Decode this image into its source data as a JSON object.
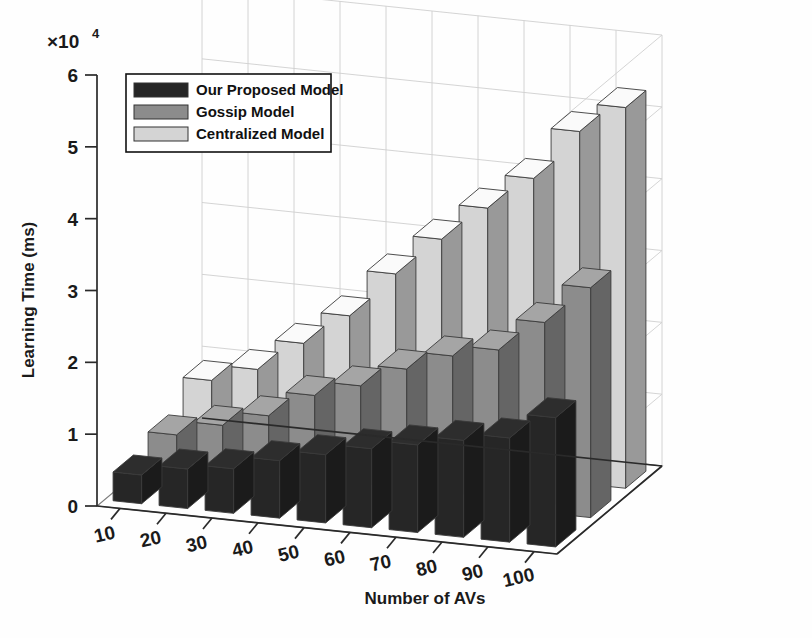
{
  "figure": {
    "title": "",
    "background": "#ffffff"
  },
  "axes": {
    "y_exponent_label": "×10",
    "y_exponent_sup": "4",
    "y_title": "Learning Time (ms)",
    "x_title": "Number of AVs",
    "y_ticks": [
      "0",
      "1",
      "2",
      "3",
      "4",
      "5",
      "6"
    ],
    "x_ticks": [
      "10",
      "20",
      "30",
      "40",
      "50",
      "60",
      "70",
      "80",
      "90",
      "100"
    ]
  },
  "legend": {
    "position": "top-left",
    "items": [
      {
        "label": "Our Proposed Model",
        "color": "#262626"
      },
      {
        "label": "Gossip Model",
        "color": "#8c8c8c"
      },
      {
        "label": "Centralized Model",
        "color": "#d4d4d4"
      }
    ]
  },
  "chart_data": {
    "type": "bar",
    "render": "3d-grouped-bar",
    "title": "",
    "xlabel": "Number of AVs",
    "ylabel": "Learning Time (ms)",
    "y_scale_factor": 10000,
    "y_scale_label": "×10^4",
    "ylim": [
      0,
      6
    ],
    "grid": true,
    "categories": [
      "10",
      "20",
      "30",
      "40",
      "50",
      "60",
      "70",
      "80",
      "90",
      "100"
    ],
    "series": [
      {
        "name": "Our Proposed Model",
        "color": "#262626",
        "values": [
          0.4,
          0.55,
          0.62,
          0.8,
          0.95,
          1.1,
          1.22,
          1.35,
          1.45,
          1.8
        ]
      },
      {
        "name": "Gossip Model",
        "color": "#8c8c8c",
        "values": [
          0.55,
          0.75,
          0.95,
          1.3,
          1.5,
          1.8,
          2.05,
          2.2,
          2.65,
          3.2
        ]
      },
      {
        "name": "Centralized Model",
        "color": "#d4d4d4",
        "values": [
          0.9,
          1.12,
          1.55,
          2.0,
          2.65,
          3.2,
          3.7,
          4.18,
          4.9,
          5.3
        ]
      }
    ],
    "legend_entries": [
      "Our Proposed Model",
      "Gossip Model",
      "Centralized Model"
    ]
  }
}
